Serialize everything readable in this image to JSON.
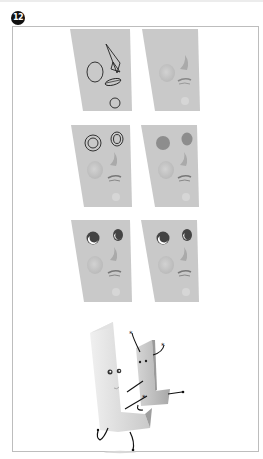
{
  "step": {
    "number": "12"
  },
  "colors": {
    "panel": "#c8c8c8",
    "panel_shade": "#bcbcbc",
    "line": "#222222",
    "eye_fill": "#8a8a8a",
    "frame_border": "#bdbdbd"
  },
  "panels": [
    {
      "row": 1,
      "side": "left",
      "stage": "guide-shapes"
    },
    {
      "row": 1,
      "side": "right",
      "stage": "sculpted-base"
    },
    {
      "row": 2,
      "side": "left",
      "stage": "eye-ring-guides"
    },
    {
      "row": 2,
      "side": "right",
      "stage": "eye-sockets-shaded"
    },
    {
      "row": 3,
      "side": "left",
      "stage": "eyes-with-highlights"
    },
    {
      "row": 3,
      "side": "right",
      "stage": "eyes-final"
    }
  ],
  "final_illustration": {
    "subject": "two-letter-L-characters-dancing"
  }
}
